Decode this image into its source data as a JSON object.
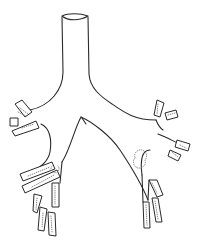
{
  "figure": {
    "parts": [
      "trachea",
      "left main bronchus",
      "right main bronchus",
      "lobar bronchi",
      "segmental bronchi"
    ],
    "colors": {
      "background": "#ffffff",
      "line": "#2a2a2a",
      "stipple": "#777777"
    }
  }
}
